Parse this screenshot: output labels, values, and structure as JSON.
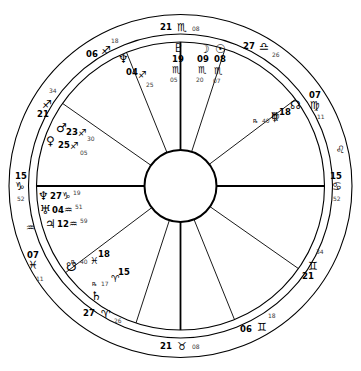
{
  "chart": {
    "type": "astrological-natal-wheel",
    "geometry": {
      "center_x": 180.5,
      "center_y": 186,
      "outer_radius": 172,
      "zodiac_inner_radius": 152,
      "house_ring_radius": 144,
      "inner_circle_radius": 36
    },
    "glyphs": {
      "aries": "♈",
      "taurus": "♉",
      "gemini": "♊",
      "cancer": "♋",
      "leo": "♌",
      "virgo": "♍",
      "libra": "♎",
      "scorpio": "♏",
      "sagittarius": "♐",
      "capricorn": "♑",
      "aquarius": "♒",
      "pisces": "♓",
      "sun": "☉",
      "moon": "☽",
      "mercury": "☿",
      "venus": "♀",
      "mars": "♂",
      "jupiter": "♃",
      "saturn": "♄",
      "uranus": "♅",
      "neptune": "♆",
      "pluto": "♇",
      "north_node": "☊",
      "south_node": "☋",
      "retrograde": "℞"
    },
    "ring_signs": [
      {
        "name": "leo-ring-marker",
        "glyph": "♌",
        "x": 336,
        "y": 145
      },
      {
        "name": "aquarius-ring-marker",
        "glyph": "♒",
        "x": 26,
        "y": 223
      }
    ],
    "cusps": [
      {
        "name": "ascendant",
        "house": 1,
        "deg": "15",
        "sign": "♑",
        "min": "52",
        "label_x": 15,
        "label_y": 172,
        "sign_x": 15,
        "sign_y": 181,
        "min_x": 17,
        "min_y": 196,
        "align": "left"
      },
      {
        "name": "cusp-2",
        "house": 2,
        "deg": "07",
        "sign": "♓",
        "min": "11",
        "label_x": 27,
        "label_y": 251,
        "sign_x": 28,
        "sign_y": 260,
        "min_x": 36,
        "min_y": 276,
        "align": "left"
      },
      {
        "name": "cusp-3",
        "house": 3,
        "deg": "27",
        "sign": "♈",
        "min": "26",
        "label_x": 83,
        "label_y": 309,
        "sign_x": 101,
        "sign_y": 309,
        "min_x": 114,
        "min_y": 318,
        "align": "left"
      },
      {
        "name": "imum-coeli",
        "house": 4,
        "deg": "21",
        "sign": "♉",
        "min": "08",
        "label_x": 160,
        "label_y": 342,
        "sign_x": 177,
        "sign_y": 341,
        "min_x": 192,
        "min_y": 344,
        "align": "left"
      },
      {
        "name": "cusp-5",
        "house": 5,
        "deg": "06",
        "sign": "♊",
        "min": "18",
        "label_x": 240,
        "label_y": 325,
        "sign_x": 257,
        "sign_y": 322,
        "min_x": 268,
        "min_y": 313,
        "align": "left"
      },
      {
        "name": "cusp-6",
        "house": 6,
        "deg": "21",
        "sign": "♊",
        "min": "34",
        "label_x": 302,
        "label_y": 272,
        "sign_x": 308,
        "sign_y": 261,
        "min_x": 316,
        "min_y": 249,
        "align": "left"
      },
      {
        "name": "descendant",
        "house": 7,
        "deg": "15",
        "sign": "♋",
        "min": "52",
        "label_x": 330,
        "label_y": 172,
        "sign_x": 332,
        "sign_y": 181,
        "min_x": 333,
        "min_y": 196,
        "align": "left"
      },
      {
        "name": "cusp-8",
        "house": 8,
        "deg": "07",
        "sign": "♍",
        "min": "11",
        "label_x": 309,
        "label_y": 91,
        "sign_x": 310,
        "sign_y": 100,
        "min_x": 317,
        "min_y": 114,
        "align": "left"
      },
      {
        "name": "cusp-9",
        "house": 9,
        "deg": "27",
        "sign": "♎",
        "min": "26",
        "label_x": 243,
        "label_y": 42,
        "sign_x": 259,
        "sign_y": 41,
        "min_x": 272,
        "min_y": 52,
        "align": "left"
      },
      {
        "name": "midheaven",
        "house": 10,
        "deg": "21",
        "sign": "♏",
        "min": "08",
        "label_x": 160,
        "label_y": 23,
        "sign_x": 177,
        "sign_y": 22,
        "min_x": 192,
        "min_y": 26,
        "align": "left"
      },
      {
        "name": "cusp-11",
        "house": 11,
        "deg": "06",
        "sign": "♐",
        "min": "18",
        "label_x": 86,
        "label_y": 50,
        "sign_x": 101,
        "sign_y": 45,
        "min_x": 111,
        "min_y": 38,
        "align": "left"
      },
      {
        "name": "cusp-12",
        "house": 12,
        "deg": "21",
        "sign": "♐",
        "min": "34",
        "label_x": 37,
        "label_y": 110,
        "sign_x": 42,
        "sign_y": 99,
        "min_x": 49,
        "min_y": 88,
        "align": "left"
      }
    ],
    "planets": [
      {
        "name": "pluto",
        "glyph": "♇",
        "deg": "19",
        "sign": "♏",
        "min": "05",
        "retro": "",
        "gx": 173,
        "gy": 42,
        "dx": 172,
        "dy": 55,
        "sx": 172,
        "sy": 65,
        "mx": 170,
        "my": 77
      },
      {
        "name": "moon",
        "glyph": "☽",
        "deg": "09",
        "sign": "♏",
        "min": "20",
        "retro": "",
        "gx": 199,
        "gy": 43,
        "dx": 197,
        "dy": 55,
        "sx": 198,
        "sy": 65,
        "mx": 196,
        "my": 77
      },
      {
        "name": "sun",
        "glyph": "☉",
        "deg": "08",
        "sign": "♏",
        "min": "07",
        "retro": "",
        "gx": 215,
        "gy": 43,
        "dx": 214,
        "dy": 55,
        "sx": 214,
        "sy": 66,
        "mx": 213,
        "my": 78
      },
      {
        "name": "north-node",
        "glyph": "☊",
        "deg": "",
        "sign": "",
        "min": "",
        "retro": "",
        "gx": 290,
        "gy": 99,
        "dx": 0,
        "dy": 0,
        "sx": 0,
        "sy": 0,
        "mx": 0,
        "my": 0
      },
      {
        "name": "mercury",
        "glyph": "☿",
        "deg": "18",
        "sign": "♍",
        "min": "40",
        "retro": "℞",
        "gx": 271,
        "gy": 111,
        "dx": 279,
        "dy": 108,
        "sx": 271,
        "sy": 111,
        "mx": 262,
        "my": 118
      },
      {
        "name": "neptune",
        "glyph": "♆",
        "deg": "04",
        "sign": "♐",
        "min": "25",
        "retro": "",
        "gx": 118,
        "gy": 53,
        "dx": 126,
        "dy": 68,
        "sx": 138,
        "sy": 70,
        "mx": 146,
        "my": 82
      },
      {
        "name": "mars",
        "glyph": "♂",
        "deg": "23",
        "sign": "♐",
        "min": "30",
        "retro": "",
        "gx": 56,
        "gy": 122,
        "dx": 66,
        "dy": 128,
        "sx": 78,
        "sy": 128,
        "mx": 87,
        "my": 136
      },
      {
        "name": "venus",
        "glyph": "♀",
        "deg": "25",
        "sign": "♐",
        "min": "05",
        "retro": "",
        "gx": 46,
        "gy": 135,
        "dx": 58,
        "dy": 141,
        "sx": 70,
        "sy": 141,
        "mx": 80,
        "my": 150
      },
      {
        "name": "saturn-cap",
        "glyph": "♆",
        "deg": "27",
        "sign": "♑",
        "min": "19",
        "retro": "",
        "gx": 38,
        "gy": 190,
        "dx": 50,
        "dy": 192,
        "sx": 62,
        "sy": 191,
        "mx": 73,
        "my": 190
      },
      {
        "name": "uranus",
        "glyph": "♅",
        "deg": "04",
        "sign": "♒",
        "min": "51",
        "retro": "",
        "gx": 40,
        "gy": 204,
        "dx": 52,
        "dy": 206,
        "sx": 64,
        "sy": 205,
        "mx": 75,
        "my": 204
      },
      {
        "name": "jupiter",
        "glyph": "♃",
        "deg": "12",
        "sign": "♒",
        "min": "59",
        "retro": "",
        "gx": 45,
        "gy": 218,
        "dx": 57,
        "dy": 220,
        "sx": 69,
        "sy": 219,
        "mx": 80,
        "my": 218
      },
      {
        "name": "south-node",
        "glyph": "☋",
        "deg": "18",
        "sign": "♓",
        "min": "40",
        "retro": "℞",
        "gx": 66,
        "gy": 261,
        "dx": 98,
        "dy": 250,
        "sx": 90,
        "sy": 256,
        "mx": 80,
        "my": 259
      },
      {
        "name": "saturn",
        "glyph": "♄",
        "deg": "15",
        "sign": "♈",
        "min": "17",
        "retro": "℞",
        "gx": 91,
        "gy": 290,
        "dx": 118,
        "dy": 268,
        "sx": 111,
        "sy": 274,
        "mx": 101,
        "my": 281
      }
    ],
    "house_lines": [
      {
        "name": "house-line-asc",
        "angle": 180
      },
      {
        "name": "house-line-2",
        "angle": 217
      },
      {
        "name": "house-line-3",
        "angle": 252
      },
      {
        "name": "house-line-ic",
        "angle": 270
      },
      {
        "name": "house-line-5",
        "angle": 292
      },
      {
        "name": "house-line-6",
        "angle": 325
      },
      {
        "name": "house-line-dsc",
        "angle": 0
      },
      {
        "name": "house-line-8",
        "angle": 37
      },
      {
        "name": "house-line-9",
        "angle": 72
      },
      {
        "name": "house-line-mc",
        "angle": 90
      },
      {
        "name": "house-line-11",
        "angle": 112
      },
      {
        "name": "house-line-12",
        "angle": 145
      }
    ]
  }
}
